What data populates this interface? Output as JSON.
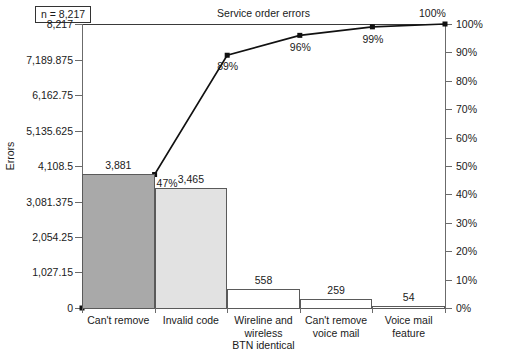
{
  "header": {
    "n_label": "n = 8,217",
    "title": "Service order errors"
  },
  "axes": {
    "y_left_title": "Errors",
    "y_left_ticks": [
      {
        "label": "8,217",
        "value": 8217
      },
      {
        "label": "7,189.875",
        "value": 7189.875
      },
      {
        "label": "6,162.75",
        "value": 6162.75
      },
      {
        "label": "5,135.625",
        "value": 5135.625
      },
      {
        "label": "4,108.5",
        "value": 4108.5
      },
      {
        "label": "3,081.375",
        "value": 3081.375
      },
      {
        "label": "2,054.25",
        "value": 2054.25
      },
      {
        "label": "1,027.15",
        "value": 1027.15
      },
      {
        "label": "0",
        "value": 0
      }
    ],
    "y_right_ticks": [
      {
        "label": "100%",
        "value": 100
      },
      {
        "label": "90%",
        "value": 90
      },
      {
        "label": "80%",
        "value": 80
      },
      {
        "label": "70%",
        "value": 70
      },
      {
        "label": "60%",
        "value": 60
      },
      {
        "label": "50%",
        "value": 50
      },
      {
        "label": "40%",
        "value": 40
      },
      {
        "label": "30%",
        "value": 30
      },
      {
        "label": "20%",
        "value": 20
      },
      {
        "label": "10%",
        "value": 10
      },
      {
        "label": "0%",
        "value": 0
      }
    ]
  },
  "chart_data": {
    "type": "bar",
    "title": "Service order errors",
    "xlabel": "",
    "ylabel": "Errors",
    "ylim": [
      0,
      8217
    ],
    "y2lim": [
      0,
      100
    ],
    "y2label": "",
    "grid": false,
    "legend": "none",
    "total_n": 8217,
    "categories": [
      "Can't remove",
      "Invalid code",
      "Wireline and wireless BTN identical",
      "Can't remove voice mail",
      "Voice mail feature"
    ],
    "category_lines": [
      [
        "Can't remove"
      ],
      [
        "Invalid code"
      ],
      [
        "Wireline and wireless",
        "BTN identical"
      ],
      [
        "Can't remove",
        "voice mail"
      ],
      [
        "Voice mail",
        "feature"
      ]
    ],
    "values": [
      3881,
      3465,
      558,
      259,
      54
    ],
    "value_labels": [
      "3,881",
      "3,465",
      "558",
      "259",
      "54"
    ],
    "bar_colors": [
      "#a9a9a9",
      "#e2e2e2",
      "#ffffff",
      "#ffffff",
      "#ffffff"
    ],
    "cumulative_percent": [
      47,
      89,
      96,
      99,
      100
    ],
    "cumulative_labels": [
      "47%",
      "89%",
      "96%",
      "99%",
      "100%"
    ],
    "series": [
      {
        "name": "Errors",
        "type": "bar",
        "values": [
          3881,
          3465,
          558,
          259,
          54
        ]
      },
      {
        "name": "Cumulative %",
        "type": "line",
        "values": [
          47,
          89,
          96,
          99,
          100
        ]
      }
    ]
  }
}
